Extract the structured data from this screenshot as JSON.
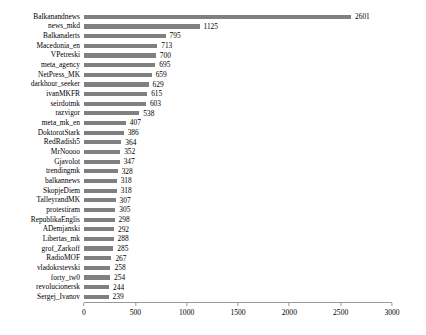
{
  "chart_data": {
    "type": "bar",
    "orientation": "horizontal",
    "title": "",
    "subtitle": "",
    "xlabel": "",
    "ylabel": "",
    "xlim": [
      0,
      3000
    ],
    "grid": false,
    "legend": null,
    "bar_color": "#808080",
    "axis_color": "#9a9a9a",
    "xticks": [
      0,
      500,
      1000,
      1500,
      2000,
      2500,
      3000
    ],
    "xtick_labels": [
      "0",
      "500",
      "1000",
      "1500",
      "2000",
      "2500",
      "3000"
    ],
    "categories": [
      "Balkanandnews",
      "news_mkd",
      "Balkanalerts",
      "Macedonia_en",
      "VPetreski",
      "meta_agency",
      "NetPress_MK",
      "darkhour_seeker",
      "ivanMKFR",
      "seirdotmk",
      "razvigor",
      "meta_mk_en",
      "DoktorotStark",
      "RedRadish5",
      "MrNoooo",
      "Gjavolot",
      "trendingmk",
      "balkannews",
      "SkopjeDiem",
      "TalleyrandMK",
      "protestiram",
      "RepublikaEnglis",
      "ADemjanski",
      "Libertas_mk",
      "grof_Zarkoff",
      "RadioMOF",
      "vladokrstevski",
      "forty_tw0",
      "revolucionersk",
      "Sergej_Ivanov"
    ],
    "values": [
      2601,
      1125,
      795,
      713,
      700,
      695,
      659,
      629,
      615,
      603,
      538,
      407,
      386,
      364,
      352,
      347,
      328,
      318,
      318,
      307,
      305,
      298,
      292,
      288,
      285,
      267,
      258,
      254,
      244,
      239
    ],
    "value_labels": [
      "2601",
      "1125",
      "795",
      "713",
      "700",
      "695",
      "659",
      "629",
      "615",
      "603",
      "538",
      "407",
      "386",
      "364",
      "352",
      "347",
      "328",
      "318",
      "318",
      "307",
      "305",
      "298",
      "292",
      "288",
      "285",
      "267",
      "258",
      "254",
      "244",
      "239"
    ]
  }
}
